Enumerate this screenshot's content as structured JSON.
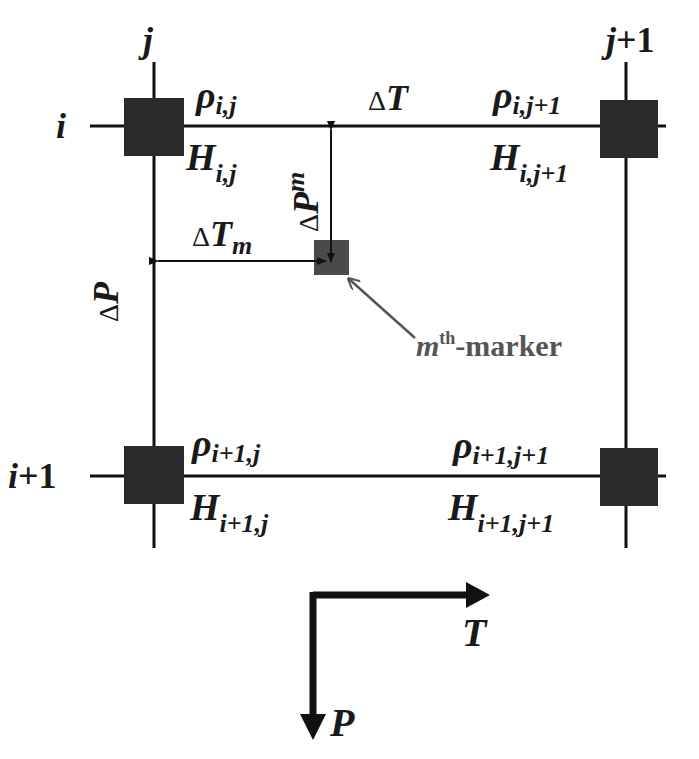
{
  "grid": {
    "columns": [
      {
        "label_base": "j",
        "label_suffix": ""
      },
      {
        "label_base": "j",
        "label_suffix": "+1"
      }
    ],
    "rows": [
      {
        "label_base": "i",
        "label_suffix": ""
      },
      {
        "label_base": "i",
        "label_suffix": "+1"
      }
    ]
  },
  "nodes": {
    "tl": {
      "rho": "ρ",
      "rho_sub": "i,j",
      "h": "H",
      "h_sub": "i,j"
    },
    "tr": {
      "rho": "ρ",
      "rho_sub": "i,j+1",
      "h": "H",
      "h_sub": "i,j+1"
    },
    "bl": {
      "rho": "ρ",
      "rho_sub": "i+1,j",
      "h": "H",
      "h_sub": "i+1,j"
    },
    "br": {
      "rho": "ρ",
      "rho_sub": "i+1,j+1",
      "h": "H",
      "h_sub": "i+1,j+1"
    }
  },
  "intervals": {
    "delta_t": {
      "delta": "Δ",
      "var": "T"
    },
    "delta_p": {
      "delta": "Δ",
      "var": "P"
    },
    "delta_t_m": {
      "delta": "Δ",
      "var": "T",
      "sub": "m"
    },
    "delta_p_m": {
      "delta": "Δ",
      "var": "P",
      "sub": "m"
    }
  },
  "marker": {
    "m": "m",
    "sup": "th",
    "text": "-marker"
  },
  "axes": {
    "x_label": "T",
    "y_label": "P"
  },
  "colors": {
    "line": "#111111",
    "node": "#2b2b2b",
    "marker": "#4a4a4a",
    "pointer": "#555555"
  }
}
